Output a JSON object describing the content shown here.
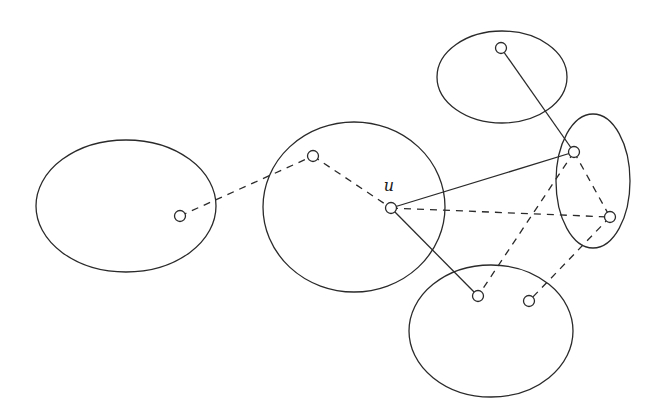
{
  "diagram": {
    "type": "clustered-graph",
    "width": 660,
    "height": 415,
    "stroke_color": "#2a2a2a",
    "background": "#ffffff",
    "clusters": [
      {
        "id": "C1",
        "cx": 126,
        "cy": 206,
        "rx": 90,
        "ry": 66
      },
      {
        "id": "C2",
        "cx": 354,
        "cy": 207,
        "rx": 91,
        "ry": 85
      },
      {
        "id": "C3",
        "cx": 502,
        "cy": 77,
        "rx": 65,
        "ry": 46
      },
      {
        "id": "C4",
        "cx": 593,
        "cy": 181,
        "rx": 37,
        "ry": 67
      },
      {
        "id": "C5",
        "cx": 491,
        "cy": 331,
        "rx": 82,
        "ry": 66
      }
    ],
    "nodes": [
      {
        "id": "n1",
        "x": 180,
        "y": 216,
        "cluster": "C1",
        "label": ""
      },
      {
        "id": "n2",
        "x": 313,
        "y": 156,
        "cluster": "C2",
        "label": ""
      },
      {
        "id": "u",
        "x": 391,
        "y": 208,
        "cluster": "C2",
        "label": "u",
        "label_x": 389,
        "label_y": 191
      },
      {
        "id": "n4",
        "x": 501,
        "y": 48,
        "cluster": "C3",
        "label": ""
      },
      {
        "id": "n5",
        "x": 574,
        "y": 152,
        "cluster": "C4",
        "label": ""
      },
      {
        "id": "n6",
        "x": 610,
        "y": 217,
        "cluster": "C4",
        "label": ""
      },
      {
        "id": "n7",
        "x": 478,
        "y": 296,
        "cluster": "C5",
        "label": ""
      },
      {
        "id": "n8",
        "x": 529,
        "y": 301,
        "cluster": "C5",
        "label": ""
      }
    ],
    "node_radius": 5.5,
    "edges": [
      {
        "from": "n1",
        "to": "n2",
        "style": "dashed"
      },
      {
        "from": "n2",
        "to": "u",
        "style": "dashed"
      },
      {
        "from": "u",
        "to": "n5",
        "style": "solid"
      },
      {
        "from": "u",
        "to": "n7",
        "style": "solid"
      },
      {
        "from": "u",
        "to": "n6",
        "style": "dashed"
      },
      {
        "from": "n4",
        "to": "n5",
        "style": "solid"
      },
      {
        "from": "n5",
        "to": "n6",
        "style": "dashed"
      },
      {
        "from": "n5",
        "to": "n7",
        "style": "dashed"
      },
      {
        "from": "n6",
        "to": "n8",
        "style": "dashed"
      }
    ]
  }
}
